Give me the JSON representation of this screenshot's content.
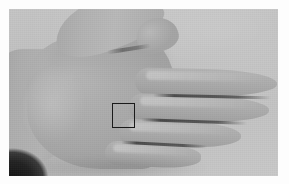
{
  "image": {
    "kind": "photograph",
    "subject": "open left hand, dorsal view, fingers extended to the right",
    "color_mode": "grayscale",
    "width": 289,
    "height": 184,
    "frame": {
      "border_color": "#fdfdfd",
      "border_width_px": 9,
      "photo_x": 9,
      "photo_y": 9,
      "photo_width": 269,
      "photo_height": 167
    },
    "palette": {
      "backdrop_gray": "#bfbfbf",
      "skin_gray": "#ababab",
      "skin_highlight": "#b9b9b9",
      "skin_shadow": "#9a9a9a",
      "crease_dark": "#343434",
      "sleeve_black": "#161616",
      "annotation_stroke": "#1a1a1a"
    }
  },
  "annotation": {
    "label": "region-of-interest",
    "shape": "square",
    "stroke_color": "#1a1a1a",
    "stroke_width_px": 1.5,
    "fill": "none",
    "x": 112,
    "y": 103,
    "width": 23,
    "height": 25
  },
  "hand": {
    "orientation": "fingers pointing right, thumb up-left",
    "visible_digits": [
      {
        "name": "thumb",
        "direction": "up-right"
      },
      {
        "name": "index-finger",
        "direction": "right"
      },
      {
        "name": "middle-finger",
        "direction": "right"
      },
      {
        "name": "ring-finger",
        "direction": "right"
      },
      {
        "name": "little-finger",
        "direction": "right"
      }
    ],
    "wrist_entry_edge": "left"
  },
  "background_objects": [
    {
      "name": "sleeve",
      "position": "bottom-left-corner",
      "tone": "black"
    }
  ]
}
